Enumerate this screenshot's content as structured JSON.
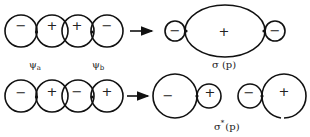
{
  "diagram": {
    "top_row": {
      "orbitals": [
        {
          "sign": "−"
        },
        {
          "sign": "+"
        },
        {
          "sign": "+"
        },
        {
          "sign": "−"
        }
      ],
      "labels": {
        "psi_a": "ψ",
        "psi_a_sub": "a",
        "psi_b": "ψ",
        "psi_b_sub": "b"
      },
      "result": {
        "left_lobe_sign": "−",
        "center_lobe_sign": "+",
        "right_lobe_sign": "−",
        "label": "σ (p)"
      }
    },
    "bottom_row": {
      "orbitals": [
        {
          "sign": "−"
        },
        {
          "sign": "+"
        },
        {
          "sign": "−"
        },
        {
          "sign": "+"
        }
      ],
      "result": {
        "left_pair": {
          "big_sign": "−",
          "small_sign": "+"
        },
        "right_pair": {
          "small_sign": "−",
          "big_sign": "+"
        },
        "label": "σ",
        "label_sup": "*",
        "label_tail": "(p)"
      }
    }
  }
}
